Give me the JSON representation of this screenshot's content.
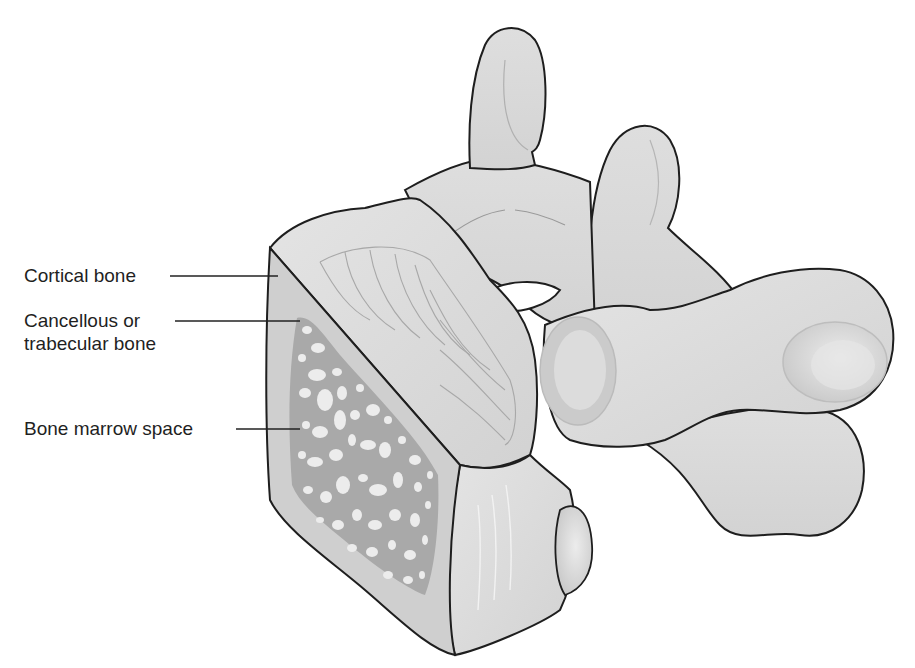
{
  "figure": {
    "colors": {
      "bone_fill": "#d9d9d9",
      "bone_light": "#e6e6e6",
      "cortical_fill": "#cfcfcf",
      "cancellous_fill": "#a9a9a9",
      "marrow_space_fill": "#ececec",
      "outline": "#1e1e1e",
      "detail_line": "#9a9a9a",
      "leader_line": "#222222"
    }
  },
  "labels": [
    {
      "id": "cortical",
      "text": "Cortical bone"
    },
    {
      "id": "cancellous",
      "line1": "Cancellous or",
      "line2": "trabecular bone"
    },
    {
      "id": "marrow",
      "text": "Bone marrow space"
    }
  ]
}
